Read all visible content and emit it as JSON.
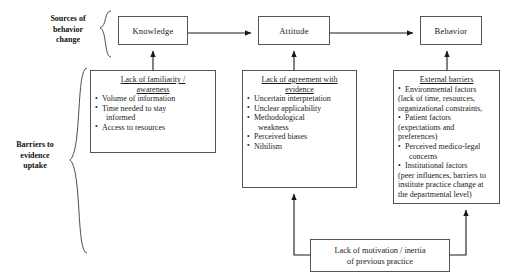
{
  "diagram": {
    "group_labels": {
      "sources": "Sources of\nbehavior\nchange",
      "sources_line1": "Sources of",
      "sources_line2": "behavior",
      "sources_line3": "change",
      "barriers_line1": "Barriers to",
      "barriers_line2": "evidence",
      "barriers_line3": "uptake"
    },
    "top_boxes": [
      {
        "label": "Knowledge"
      },
      {
        "label": "Attitude"
      },
      {
        "label": "Behavior"
      }
    ],
    "barrier_boxes": [
      {
        "title": "Lack of familiarity /\nawareness",
        "title_line1": "Lack of familiarity /",
        "title_line2": "awareness",
        "items": [
          {
            "text": "Volume of information",
            "style": "bullet"
          },
          {
            "text": "Time needed to stay",
            "style": "bullet"
          },
          {
            "text": "informed",
            "style": "indent"
          },
          {
            "text": "Access to resources",
            "style": "bullet"
          }
        ]
      },
      {
        "title": "Lack of agreement with\nevidence",
        "title_line1": "Lack of agreement with",
        "title_line2": "evidence",
        "items": [
          {
            "text": "Uncertain interpretation",
            "style": "bullet"
          },
          {
            "text": "Unclear applicability",
            "style": "bullet"
          },
          {
            "text": "Methodological",
            "style": "bullet"
          },
          {
            "text": "weakness",
            "style": "indent"
          },
          {
            "text": "Perceived biases",
            "style": "bullet"
          },
          {
            "text": "Nihilism",
            "style": "bullet"
          }
        ]
      },
      {
        "title": "External barriers",
        "title_line1": "External barriers",
        "title_line2": "",
        "items": [
          {
            "text": "Environmental factors",
            "style": "bullet"
          },
          {
            "text": "(lack of time, resources,",
            "style": "cont"
          },
          {
            "text": "organizational constraints,",
            "style": "cont"
          },
          {
            "text": "Patient factors",
            "style": "bullet"
          },
          {
            "text": "(expectations and",
            "style": "cont"
          },
          {
            "text": "preferences)",
            "style": "cont"
          },
          {
            "text": "Perceived medico-legal",
            "style": "bullet"
          },
          {
            "text": "concerns",
            "style": "indent"
          },
          {
            "text": "Institutional factors",
            "style": "bullet"
          },
          {
            "text": "(peer influences, barriers to",
            "style": "cont"
          },
          {
            "text": "institute practice change at",
            "style": "cont"
          },
          {
            "text": "the departmental level)",
            "style": "cont"
          }
        ]
      }
    ],
    "bottom_box": {
      "line1": "Lack of motivation / inertia",
      "line2": "of previous practice"
    },
    "colors": {
      "box_border": "#555555",
      "arrow": "#1a1a1a",
      "background": "#ffffff",
      "text": "#1a1a1a"
    }
  }
}
